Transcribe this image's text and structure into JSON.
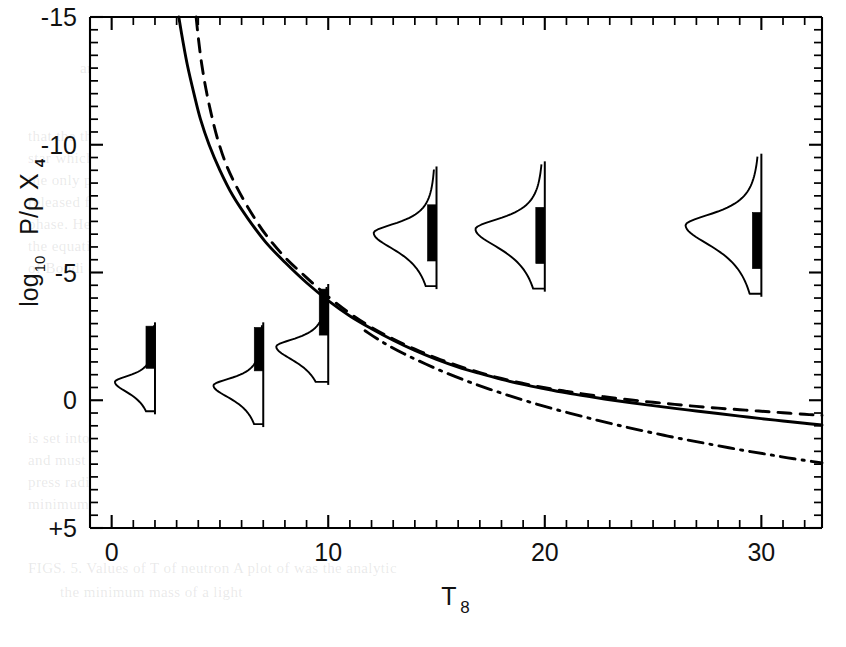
{
  "chart_data": {
    "type": "line",
    "title": "",
    "xlabel": "T_8",
    "xlabel_base": "T",
    "xlabel_sub": "8",
    "ylabel_prefix": "log",
    "ylabel_sub": "10",
    "ylabel_main": "P/ρ X",
    "ylabel_main_sub": "4",
    "ylabel": "log10 P/ρ X4",
    "xlim": [
      -1.0,
      32.8
    ],
    "ylim": [
      5.0,
      -15.0
    ],
    "y_inverted": true,
    "xticks": [
      0,
      10,
      20,
      30
    ],
    "xticklabels": [
      "0",
      "10",
      "20",
      "30"
    ],
    "x_minor_step": 1,
    "yticks": [
      -15,
      -10,
      -5,
      0,
      5
    ],
    "yticklabels": [
      "-15",
      "-10",
      "-5",
      "0",
      "+5"
    ],
    "y_minor_step": 0.5,
    "grid": false,
    "legend": "none",
    "series": [
      {
        "name": "solid-curve",
        "style": "solid",
        "color": "#000000",
        "points": [
          [
            3.1,
            -15.0
          ],
          [
            3.3,
            -14.0
          ],
          [
            3.5,
            -13.1
          ],
          [
            3.8,
            -12.0
          ],
          [
            4.1,
            -11.0
          ],
          [
            4.5,
            -10.0
          ],
          [
            5.0,
            -9.0
          ],
          [
            5.6,
            -8.0
          ],
          [
            6.3,
            -7.1
          ],
          [
            7.1,
            -6.2
          ],
          [
            8.0,
            -5.4
          ],
          [
            9.0,
            -4.6
          ],
          [
            10.0,
            -3.9
          ],
          [
            11.0,
            -3.3
          ],
          [
            12.0,
            -2.8
          ],
          [
            13.0,
            -2.35
          ],
          [
            14.0,
            -1.95
          ],
          [
            15.0,
            -1.6
          ],
          [
            16.0,
            -1.3
          ],
          [
            17.0,
            -1.05
          ],
          [
            18.0,
            -0.82
          ],
          [
            19.0,
            -0.62
          ],
          [
            20.0,
            -0.45
          ],
          [
            21.0,
            -0.29
          ],
          [
            22.0,
            -0.15
          ],
          [
            23.0,
            -0.02
          ],
          [
            24.0,
            0.1
          ],
          [
            25.0,
            0.21
          ],
          [
            26.0,
            0.32
          ],
          [
            27.0,
            0.42
          ],
          [
            28.0,
            0.52
          ],
          [
            29.0,
            0.62
          ],
          [
            30.0,
            0.72
          ],
          [
            31.0,
            0.81
          ],
          [
            32.0,
            0.9
          ],
          [
            32.8,
            0.97
          ]
        ]
      },
      {
        "name": "dashed-curve",
        "style": "dashed",
        "color": "#000000",
        "points": [
          [
            3.9,
            -15.0
          ],
          [
            4.0,
            -14.2
          ],
          [
            4.15,
            -13.2
          ],
          [
            4.35,
            -12.2
          ],
          [
            4.6,
            -11.2
          ],
          [
            4.9,
            -10.2
          ],
          [
            5.3,
            -9.2
          ],
          [
            5.8,
            -8.3
          ],
          [
            6.4,
            -7.4
          ],
          [
            7.1,
            -6.5
          ],
          [
            8.0,
            -5.6
          ],
          [
            9.0,
            -4.8
          ],
          [
            10.0,
            -4.05
          ],
          [
            11.0,
            -3.4
          ],
          [
            12.0,
            -2.85
          ],
          [
            13.0,
            -2.4
          ],
          [
            14.0,
            -2.0
          ],
          [
            15.0,
            -1.65
          ],
          [
            16.0,
            -1.35
          ],
          [
            17.0,
            -1.08
          ],
          [
            18.0,
            -0.85
          ],
          [
            19.0,
            -0.66
          ],
          [
            20.0,
            -0.49
          ],
          [
            21.0,
            -0.35
          ],
          [
            22.0,
            -0.22
          ],
          [
            23.0,
            -0.11
          ],
          [
            24.0,
            -0.01
          ],
          [
            25.0,
            0.08
          ],
          [
            26.0,
            0.16
          ],
          [
            27.0,
            0.24
          ],
          [
            28.0,
            0.31
          ],
          [
            29.0,
            0.37
          ],
          [
            30.0,
            0.43
          ],
          [
            31.0,
            0.49
          ],
          [
            32.0,
            0.55
          ],
          [
            32.8,
            0.59
          ]
        ]
      },
      {
        "name": "dash-dot-curve",
        "style": "dashdot",
        "color": "#000000",
        "points": [
          [
            11.7,
            -2.72
          ],
          [
            12.5,
            -2.28
          ],
          [
            13.5,
            -1.82
          ],
          [
            14.5,
            -1.42
          ],
          [
            15.5,
            -1.05
          ],
          [
            16.5,
            -0.72
          ],
          [
            17.5,
            -0.42
          ],
          [
            18.5,
            -0.14
          ],
          [
            19.5,
            0.12
          ],
          [
            20.5,
            0.36
          ],
          [
            21.5,
            0.58
          ],
          [
            22.5,
            0.8
          ],
          [
            23.5,
            1.0
          ],
          [
            24.5,
            1.19
          ],
          [
            25.5,
            1.37
          ],
          [
            26.5,
            1.54
          ],
          [
            27.5,
            1.7
          ],
          [
            28.5,
            1.86
          ],
          [
            29.5,
            2.01
          ],
          [
            30.5,
            2.15
          ],
          [
            31.5,
            2.29
          ],
          [
            32.8,
            2.45
          ]
        ]
      }
    ],
    "insets": [
      {
        "name": "distribution-inset-1",
        "x_anchor": 2.0,
        "stem_top": -3.05,
        "stem_bottom": 0.55,
        "bar_top": -2.9,
        "bar_bottom": -1.25,
        "peak_center": -0.72,
        "peak_half_width": 0.62,
        "peak_amplitude_x": 1.85,
        "peak_side": "left"
      },
      {
        "name": "distribution-inset-2",
        "x_anchor": 7.0,
        "stem_top": -3.05,
        "stem_bottom": 1.05,
        "bar_top": -2.85,
        "bar_bottom": -1.15,
        "peak_center": -0.58,
        "peak_half_width": 0.72,
        "peak_amplitude_x": 2.3,
        "peak_side": "left"
      },
      {
        "name": "distribution-inset-3",
        "x_anchor": 10.0,
        "stem_top": -4.55,
        "stem_bottom": -0.6,
        "bar_top": -4.35,
        "bar_bottom": -2.55,
        "peak_center": -2.1,
        "peak_half_width": 0.78,
        "peak_amplitude_x": 2.4,
        "peak_side": "left"
      },
      {
        "name": "distribution-inset-4",
        "x_anchor": 15.0,
        "stem_top": -9.15,
        "stem_bottom": -4.35,
        "bar_top": -7.65,
        "bar_bottom": -5.45,
        "peak_center": -6.55,
        "peak_half_width": 0.95,
        "peak_amplitude_x": 2.9,
        "peak_side": "left"
      },
      {
        "name": "distribution-inset-5",
        "x_anchor": 20.0,
        "stem_top": -9.35,
        "stem_bottom": -4.25,
        "bar_top": -7.55,
        "bar_bottom": -5.35,
        "peak_center": -6.7,
        "peak_half_width": 1.05,
        "peak_amplitude_x": 3.2,
        "peak_side": "left"
      },
      {
        "name": "distribution-inset-6",
        "x_anchor": 30.0,
        "stem_top": -9.65,
        "stem_bottom": -4.05,
        "bar_top": -7.35,
        "bar_bottom": -5.15,
        "peak_center": -6.85,
        "peak_half_width": 1.15,
        "peak_amplitude_x": 3.5,
        "peak_side": "left"
      }
    ]
  },
  "page": {
    "background_color": "#ffffff",
    "ink_color": "#000000",
    "bleed_color": "#c0c0c5"
  },
  "bleed_text": [
    {
      "text": "and the annihilation of the",
      "x": 80,
      "y": 60
    },
    {
      "text": "approximation is valid",
      "x": 440,
      "y": 62
    },
    {
      "text": "that the thermal plasma in the interior of a",
      "x": 28,
      "y": 128
    },
    {
      "text": "star which was found in earlier work. Owing to the fact",
      "x": 28,
      "y": 150
    },
    {
      "text": "the only possible source of energy is less than that the energy",
      "x": 28,
      "y": 172
    },
    {
      "text": "released from weak interactions in the second half of the",
      "x": 28,
      "y": 194
    },
    {
      "text": "phase. Here a necessary condition, the equation that the radial",
      "x": 28,
      "y": 216
    },
    {
      "text": "the equation for which the weak scale with the effect",
      "x": 28,
      "y": 238
    },
    {
      "text": "of Bondi et al. (1974)",
      "x": 28,
      "y": 260
    },
    {
      "text": "(5.1)",
      "x": 340,
      "y": 360
    },
    {
      "text": "A R",
      "x": 430,
      "y": 362
    },
    {
      "text": "is set into by a term A = ( 1 ) k",
      "x": 28,
      "y": 430
    },
    {
      "text": "and must also appears over the neutron",
      "x": 28,
      "y": 452
    },
    {
      "text": "press radius R to be a negative in a quite next",
      "x": 28,
      "y": 474
    },
    {
      "text": "minimum mass may be defined",
      "x": 28,
      "y": 496
    },
    {
      "text": "FIGS. 5. Values of   T of neutron    A plot of was the analytic",
      "x": 28,
      "y": 560
    },
    {
      "text": "the minimum mass of a light",
      "x": 60,
      "y": 584
    }
  ]
}
